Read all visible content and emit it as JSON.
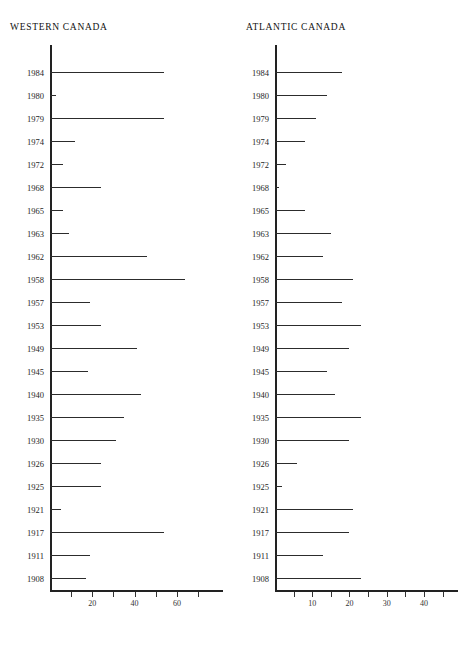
{
  "figure": {
    "background": "#ffffff",
    "ink_color": "#2c2c2c"
  },
  "panels": [
    {
      "id": "west",
      "title": "WESTERN CANADA"
    },
    {
      "id": "atlantic",
      "title": "ATLANTIC CANADA"
    }
  ],
  "chart_data": [
    {
      "type": "bar",
      "orientation": "horizontal",
      "title": "WESTERN CANADA",
      "xlabel": "",
      "ylabel": "",
      "xlim": [
        0,
        78
      ],
      "xticks": [
        10,
        20,
        30,
        40,
        50,
        60,
        70
      ],
      "xticklabels": [
        "",
        "20",
        "",
        "40",
        "",
        "60",
        ""
      ],
      "grid": false,
      "legend": false,
      "categories": [
        "1984",
        "1980",
        "1979",
        "1974",
        "1972",
        "1968",
        "1965",
        "1963",
        "1962",
        "1958",
        "1957",
        "1953",
        "1949",
        "1945",
        "1940",
        "1935",
        "1930",
        "1926",
        "1925",
        "1921",
        "1917",
        "1911",
        "1908"
      ],
      "values": [
        54,
        3,
        54,
        12,
        6,
        24,
        6,
        9,
        46,
        64,
        19,
        24,
        41,
        18,
        43,
        35,
        31,
        24,
        24,
        5,
        54,
        19,
        17
      ]
    },
    {
      "type": "bar",
      "orientation": "horizontal",
      "title": "ATLANTIC CANADA",
      "xlabel": "",
      "ylabel": "",
      "xlim": [
        0,
        47
      ],
      "xticks": [
        5,
        10,
        15,
        20,
        25,
        30,
        35,
        40,
        45
      ],
      "xticklabels": [
        "",
        "10",
        "",
        "20",
        "",
        "30",
        "",
        "40",
        ""
      ],
      "grid": false,
      "legend": false,
      "categories": [
        "1984",
        "1980",
        "1979",
        "1974",
        "1972",
        "1968",
        "1965",
        "1963",
        "1962",
        "1958",
        "1957",
        "1953",
        "1949",
        "1945",
        "1940",
        "1935",
        "1930",
        "1926",
        "1925",
        "1921",
        "1917",
        "1911",
        "1908"
      ],
      "values": [
        18,
        14,
        11,
        8,
        3,
        1,
        8,
        15,
        13,
        21,
        18,
        23,
        20,
        14,
        16,
        23,
        20,
        6,
        2,
        21,
        20,
        13,
        23
      ]
    }
  ]
}
